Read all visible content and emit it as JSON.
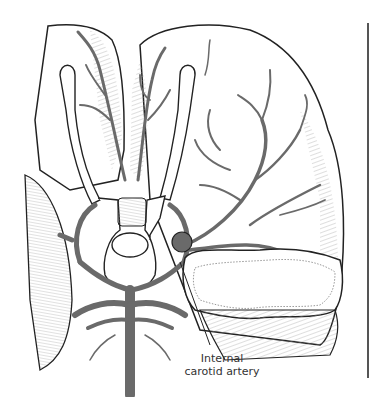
{
  "figure": {
    "labels": [
      {
        "text_line1": "Internal",
        "text_line2": "carotid artery"
      }
    ],
    "colors": {
      "artery": "#6a6a6a",
      "outline": "#222222",
      "hatch": "#9a9a9a",
      "background": "#ffffff",
      "rule": "#555555"
    }
  }
}
